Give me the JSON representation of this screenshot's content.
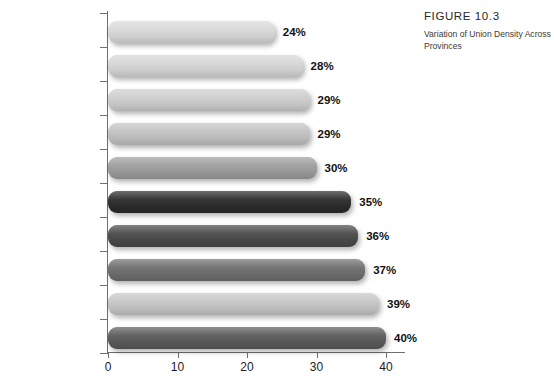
{
  "caption": {
    "figure_number": "FIGURE 10.3",
    "description": "Variation of Union Density Across Provinces"
  },
  "chart_data": {
    "type": "bar",
    "orientation": "horizontal",
    "title": "Variation of Union Density Across Provinces",
    "xlabel": "",
    "ylabel": "",
    "xlim": [
      0,
      43
    ],
    "xticks": [
      0,
      10,
      20,
      30,
      40
    ],
    "xtick_labels": [
      "0",
      "10",
      "20",
      "30",
      "40"
    ],
    "grid": false,
    "legend": "none",
    "value_suffix": "%",
    "categories": [
      "Alberta",
      "Ontario",
      "P.E.I.",
      "New Brunswick",
      "Nova Scotia",
      "Saskatchewan",
      "B.C.",
      "Manitoba",
      "Newfoundland",
      "Quebec"
    ],
    "values": [
      24,
      28,
      29,
      29,
      30,
      35,
      36,
      37,
      39,
      40
    ],
    "value_labels": [
      "24%",
      "28%",
      "29%",
      "29%",
      "30%",
      "35%",
      "36%",
      "37%",
      "39%",
      "40%"
    ],
    "bar_colors": [
      "#d9d9d9",
      "#d6d6d6",
      "#cdcdcd",
      "#c2c2c2",
      "#9d9d9d",
      "#2b2b2b",
      "#4a4a4a",
      "#6e6e6e",
      "#c6c6c6",
      "#5a5a5a"
    ]
  }
}
